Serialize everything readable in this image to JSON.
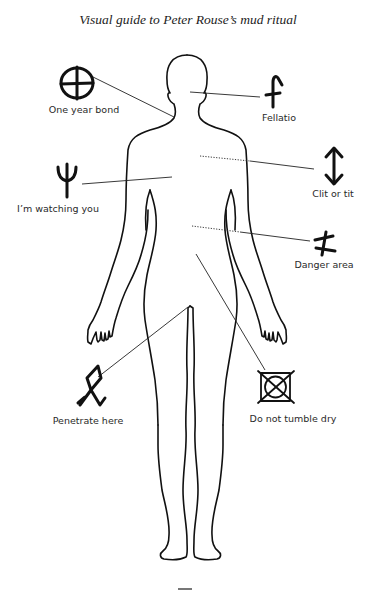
{
  "title": "Visual guide to Peter Rouse’s mud ritual",
  "colors": {
    "ink": "#111111",
    "text": "#2a2a2a",
    "background": "#ffffff"
  },
  "annotations": [
    {
      "id": "one-year-bond",
      "label": "One year bond",
      "icon": "circle-cross-icon",
      "side": "left"
    },
    {
      "id": "fellatio",
      "label": "Fellatio",
      "icon": "f-rune-icon",
      "side": "right"
    },
    {
      "id": "im-watching-you",
      "label": "I’m watching you",
      "icon": "trident-icon",
      "side": "left"
    },
    {
      "id": "clit-or-tit",
      "label": "Clit or tit",
      "icon": "double-arrow-icon",
      "side": "right"
    },
    {
      "id": "danger-area",
      "label": "Danger area",
      "icon": "crossed-stem-icon",
      "side": "right"
    },
    {
      "id": "penetrate-here",
      "label": "Penetrate here",
      "icon": "othala-rune-icon",
      "side": "left"
    },
    {
      "id": "do-not-tumble-dry",
      "label": "Do not tumble dry",
      "icon": "no-tumble-dry-icon",
      "side": "right"
    }
  ],
  "page_mark": "—"
}
